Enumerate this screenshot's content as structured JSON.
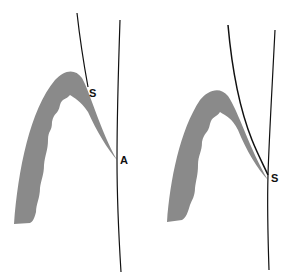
{
  "diagram": {
    "panels": [
      {
        "id": "left",
        "labels": {
          "upper": "S",
          "contact": "A"
        }
      },
      {
        "id": "right",
        "labels": {
          "contact": "S"
        }
      }
    ],
    "colors": {
      "fill": "#8a8a8a",
      "line": "#111111",
      "background": "#ffffff"
    }
  }
}
